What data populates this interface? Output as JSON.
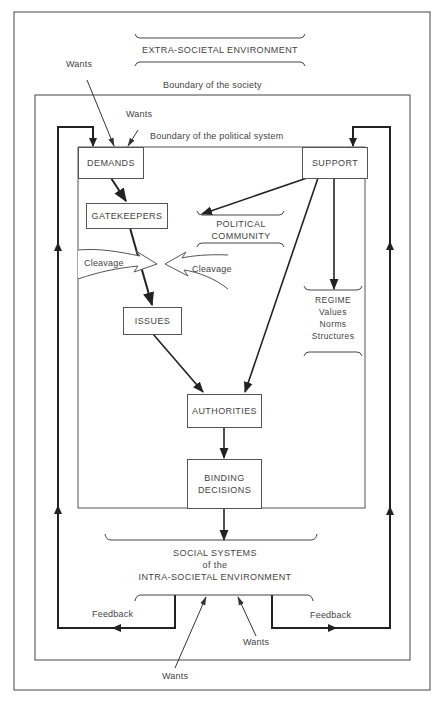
{
  "diagram": {
    "title": "EXTRA-SOCIETAL ENVIRONMENT",
    "boundaries": {
      "society": "Boundary of the society",
      "political_system": "Boundary of the political system"
    },
    "nodes": {
      "demands": "DEMANDS",
      "support": "SUPPORT",
      "gatekeepers": "GATEKEEPERS",
      "issues": "ISSUES",
      "authorities": "AUTHORITIES",
      "binding_decisions_line1": "BINDING",
      "binding_decisions_line2": "DECISIONS"
    },
    "support_objects": {
      "political_community_line1": "POLITICAL",
      "political_community_line2": "COMMUNITY",
      "regime": "REGIME",
      "regime_values": "Values",
      "regime_norms": "Norms",
      "regime_structures": "Structures"
    },
    "cleavage": {
      "left": "Cleavage",
      "right": "Cleavage"
    },
    "intra_societal": {
      "line1": "SOCIAL SYSTEMS",
      "line2": "of the",
      "line3": "INTRA-SOCIETAL ENVIRONMENT"
    },
    "wants_labels": {
      "top_outer": "Wants",
      "top_inner": "Wants",
      "bottom_inner": "Wants",
      "bottom_outer": "Wants"
    },
    "feedback_labels": {
      "left": "Feedback",
      "right": "Feedback"
    },
    "edges": [
      {
        "from": "Wants (extra-societal)",
        "to": "DEMANDS"
      },
      {
        "from": "Wants (society)",
        "to": "DEMANDS"
      },
      {
        "from": "DEMANDS",
        "to": "GATEKEEPERS"
      },
      {
        "from": "GATEKEEPERS",
        "to": "ISSUES"
      },
      {
        "from": "ISSUES",
        "to": "AUTHORITIES"
      },
      {
        "from": "SUPPORT",
        "to": "POLITICAL COMMUNITY"
      },
      {
        "from": "SUPPORT",
        "to": "AUTHORITIES"
      },
      {
        "from": "SUPPORT",
        "to": "REGIME"
      },
      {
        "from": "AUTHORITIES",
        "to": "BINDING DECISIONS"
      },
      {
        "from": "BINDING DECISIONS",
        "to": "SOCIAL SYSTEMS of the INTRA-SOCIETAL ENVIRONMENT"
      },
      {
        "from": "SOCIAL SYSTEMS",
        "to": "DEMANDS",
        "label": "Feedback"
      },
      {
        "from": "SOCIAL SYSTEMS",
        "to": "SUPPORT",
        "label": "Feedback"
      },
      {
        "from": "Wants (bottom)",
        "to": "SOCIAL SYSTEMS"
      }
    ]
  }
}
